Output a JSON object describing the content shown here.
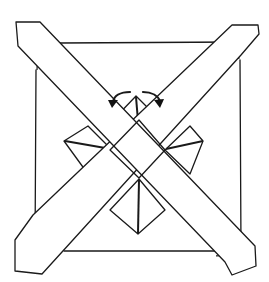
{
  "diagram": {
    "type": "origami-fold-diagram",
    "colors": {
      "ink": "#1a1a1a",
      "background": "#ffffff"
    },
    "elements": {
      "base_square": "square-sheet",
      "strips": [
        "diagonal-strip-tl-br",
        "diagonal-strip-tr-bl"
      ],
      "hidden_edges": "dashed-corner-lines",
      "center": "center-diamond",
      "flaps": [
        "flap-top",
        "flap-left",
        "flap-right",
        "flap-bottom"
      ],
      "arrows": [
        "fold-arrow-left",
        "fold-arrow-right"
      ]
    }
  }
}
